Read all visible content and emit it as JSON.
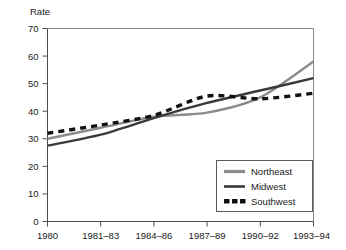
{
  "chart_data": {
    "type": "line",
    "title": "",
    "xlabel": "",
    "ylabel": "Rate",
    "ylim": [
      0,
      70
    ],
    "yticks": [
      0,
      10,
      20,
      30,
      40,
      50,
      60,
      70
    ],
    "grid": false,
    "legend_position": "bottom-right inside plot area",
    "categories": [
      "1980",
      "1981–83",
      "1984–86",
      "1987–89",
      "1990–92",
      "1993–94"
    ],
    "series": [
      {
        "name": "Northeast",
        "color": "#8c8c8c",
        "style": "solid",
        "values": [
          30,
          34,
          38,
          39.5,
          45,
          58
        ]
      },
      {
        "name": "Midwest",
        "color": "#3a3a3a",
        "style": "solid",
        "values": [
          27.5,
          31.5,
          37.5,
          43,
          47.5,
          52
        ]
      },
      {
        "name": "Southwest",
        "color": "#111111",
        "style": "dashed",
        "values": [
          32,
          35,
          38.5,
          45.5,
          44.5,
          46.5
        ]
      }
    ]
  },
  "axis": {
    "y_title": "Rate",
    "y_tick_labels": [
      "70",
      "60",
      "50",
      "40",
      "30",
      "20",
      "10",
      "0"
    ],
    "x_tick_labels": [
      "1980",
      "1981–83",
      "1984–86",
      "1987–89",
      "1990–92",
      "1993–94"
    ]
  },
  "legend": {
    "entries": [
      {
        "label": "Northeast",
        "color": "#8c8c8c",
        "style": "solid"
      },
      {
        "label": "Midwest",
        "color": "#3a3a3a",
        "style": "solid"
      },
      {
        "label": "Southwest",
        "color": "#111111",
        "style": "dotted"
      }
    ]
  },
  "colors": {
    "background": "#ffffff",
    "axis": "#4d4d4d",
    "frame": "#8a8a8a",
    "text": "#1a1a1a",
    "northeast": "#8c8c8c",
    "midwest": "#3a3a3a",
    "southwest": "#111111"
  }
}
